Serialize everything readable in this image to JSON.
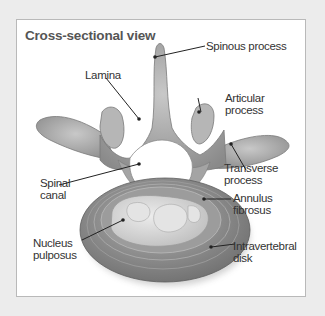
{
  "diagram": {
    "title": "Cross-sectional view",
    "labels": {
      "spinous_process": "Spinous process",
      "lamina": "Lamina",
      "articular_process_1": "Articular",
      "articular_process_2": "process",
      "transverse_process_1": "Transverse",
      "transverse_process_2": "process",
      "spinal_canal_1": "Spinal",
      "spinal_canal_2": "canal",
      "annulus_fibrosus_1": "Annulus",
      "annulus_fibrosus_2": "fibrosus",
      "nucleus_pulposus_1": "Nucleus",
      "nucleus_pulposus_2": "pulposus",
      "intravertebral_disk_1": "Intravertebral",
      "intravertebral_disk_2": "disk"
    },
    "colors": {
      "background": "#ececec",
      "frame": "#ffffff",
      "frame_border": "#b9b9b9",
      "bone": "#a9a9a9",
      "bone_dark": "#7d7d7d",
      "disk_outer": "#8e8e8e",
      "nucleus": "#d9d9d9",
      "leader_line": "#222222",
      "text": "#333333",
      "title": "#555555"
    }
  }
}
